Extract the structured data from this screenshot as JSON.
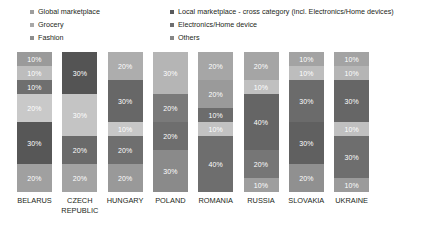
{
  "chart_data": {
    "type": "bar",
    "title": "",
    "subtitle": "",
    "xlabel": "",
    "ylabel": "",
    "ylim": [
      0,
      100
    ],
    "grid": false,
    "stacked": true,
    "stack_unit": "%",
    "legend_position": "top",
    "legend": [
      {
        "name": "Global marketplace",
        "color": "#9d9d9d"
      },
      {
        "name": "Grocery",
        "color": "#a8a8a8"
      },
      {
        "name": "Fashion",
        "color": "#8e8e8e"
      },
      {
        "name": "Local marketplace - cross category (incl. Electronics/Home devices)",
        "color": "#58595b"
      },
      {
        "name": "Electronics/Home device",
        "color": "#6d6e70"
      },
      {
        "name": "Others",
        "color": "#868686"
      }
    ],
    "categories": [
      "BELARUS",
      "CZECH REPUBLIC",
      "HUNGARY",
      "POLAND",
      "ROMANIA",
      "RUSSIA",
      "SLOVAKIA",
      "UKRAINE"
    ],
    "bars": [
      {
        "category": "BELARUS",
        "segments": [
          {
            "value": 10,
            "label": "10%",
            "color": "#9a9a9a"
          },
          {
            "value": 10,
            "label": "10%",
            "color": "#bdbdbd"
          },
          {
            "value": 10,
            "label": "10%",
            "color": "#6f6f6f"
          },
          {
            "value": 20,
            "label": "20%",
            "color": "#c9c9c9"
          },
          {
            "value": 30,
            "label": "30%",
            "color": "#575757"
          },
          {
            "value": 20,
            "label": "20%",
            "color": "#a0a0a0"
          }
        ]
      },
      {
        "category": "CZECH REPUBLIC",
        "segments": [
          {
            "value": 30,
            "label": "30%",
            "color": "#545454"
          },
          {
            "value": 30,
            "label": "30%",
            "color": "#c4c4c4"
          },
          {
            "value": 20,
            "label": "20%",
            "color": "#6a6a6a"
          },
          {
            "value": 20,
            "label": "20%",
            "color": "#a3a3a3"
          }
        ]
      },
      {
        "category": "HUNGARY",
        "segments": [
          {
            "value": 20,
            "label": "20%",
            "color": "#adadad"
          },
          {
            "value": 30,
            "label": "30%",
            "color": "#676767"
          },
          {
            "value": 10,
            "label": "10%",
            "color": "#c7c7c7"
          },
          {
            "value": 20,
            "label": "20%",
            "color": "#6f6f6f"
          },
          {
            "value": 20,
            "label": "20%",
            "color": "#999999"
          }
        ]
      },
      {
        "category": "POLAND",
        "segments": [
          {
            "value": 30,
            "label": "30%",
            "color": "#b5b5b5"
          },
          {
            "value": 20,
            "label": "20%",
            "color": "#7a7a7a"
          },
          {
            "value": 20,
            "label": "20%",
            "color": "#6e6e6e"
          },
          {
            "value": 30,
            "label": "30%",
            "color": "#8a8a8a"
          }
        ]
      },
      {
        "category": "ROMANIA",
        "segments": [
          {
            "value": 20,
            "label": "20%",
            "color": "#a6a6a6"
          },
          {
            "value": 20,
            "label": "20%",
            "color": "#9a9a9a"
          },
          {
            "value": 10,
            "label": "10%",
            "color": "#6c6c6c"
          },
          {
            "value": 10,
            "label": "10%",
            "color": "#c2c2c2"
          },
          {
            "value": 40,
            "label": "40%",
            "color": "#6e6e6e"
          }
        ]
      },
      {
        "category": "RUSSIA",
        "segments": [
          {
            "value": 20,
            "label": "20%",
            "color": "#a5a5a5"
          },
          {
            "value": 10,
            "label": "10%",
            "color": "#c0c0c0"
          },
          {
            "value": 40,
            "label": "40%",
            "color": "#656565"
          },
          {
            "value": 20,
            "label": "20%",
            "color": "#767676"
          },
          {
            "value": 10,
            "label": "10%",
            "color": "#9e9e9e"
          }
        ]
      },
      {
        "category": "SLOVAKIA",
        "segments": [
          {
            "value": 10,
            "label": "10%",
            "color": "#a3a3a3"
          },
          {
            "value": 10,
            "label": "10%",
            "color": "#bdbdbd"
          },
          {
            "value": 30,
            "label": "30%",
            "color": "#6b6b6b"
          },
          {
            "value": 30,
            "label": "30%",
            "color": "#606060"
          },
          {
            "value": 20,
            "label": "20%",
            "color": "#909090"
          }
        ]
      },
      {
        "category": "UKRAINE",
        "segments": [
          {
            "value": 10,
            "label": "10%",
            "color": "#a3a3a3"
          },
          {
            "value": 10,
            "label": "10%",
            "color": "#b5b5b5"
          },
          {
            "value": 30,
            "label": "30%",
            "color": "#666666"
          },
          {
            "value": 10,
            "label": "10%",
            "color": "#c0c0c0"
          },
          {
            "value": 30,
            "label": "30%",
            "color": "#6e6e6e"
          },
          {
            "value": 10,
            "label": "10%",
            "color": "#9b9b9b"
          }
        ]
      }
    ]
  }
}
